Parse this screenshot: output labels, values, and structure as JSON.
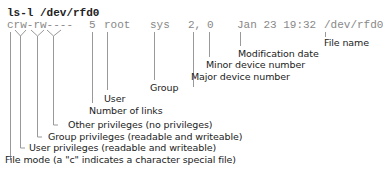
{
  "command": "ls-l /dev/rfd0",
  "output": {
    "mode": "crw-rw----",
    "links": "5",
    "user": "root",
    "group": "sys",
    "major": "2,",
    "minor": "0",
    "date": "Jan 23 19:32",
    "filename": "/dev/rfd0"
  },
  "labels": {
    "modification_date": "Modification date",
    "file_name": "File name",
    "minor_device": "Minor device number",
    "major_device": "Major device number",
    "group": "Group",
    "user": "User",
    "number_of_links": "Number of links",
    "other_privileges": "Other privileges (no privileges)",
    "group_privileges": "Group privileges (readable and writeable)",
    "user_privileges": "User privileges (readable and writeable)",
    "file_mode": "File mode (a \"c\" indicates a character special file)"
  },
  "colors": {
    "text": "#222222",
    "output_text": "#888888",
    "lines": "#999999"
  }
}
